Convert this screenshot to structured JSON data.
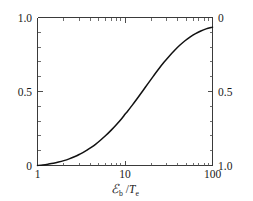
{
  "chart_data": {
    "type": "line",
    "title": "",
    "subtitle": "",
    "xlabel": "ℰb / Te",
    "xlabel_parts": {
      "numerator_symbol": "ℰ",
      "numerator_subscript": "b",
      "divider": "/",
      "denominator_symbol": "T",
      "denominator_subscript": "e"
    },
    "ylabel": "",
    "ylabel_right": "",
    "xscale": "log",
    "yscale": "linear",
    "xlim": [
      1,
      100
    ],
    "ylim": [
      0,
      1
    ],
    "ylim_right": [
      1,
      0
    ],
    "grid": false,
    "legend": false,
    "legend_position": "none",
    "xticks": [
      1,
      10,
      100
    ],
    "xtick_labels": [
      "1",
      "10",
      "100"
    ],
    "yticks_left": [
      0,
      0.5,
      1.0
    ],
    "ytick_labels_left": [
      "0",
      "0.5",
      "1.0"
    ],
    "yticks_right": [
      0,
      0.5,
      1.0
    ],
    "ytick_labels_right": [
      "0",
      "0.5",
      "1.0"
    ],
    "ytick_right_inverted": true,
    "ytick_minor_step_left": 0.1,
    "series": [
      {
        "name": "curve",
        "color": "#111111",
        "x": [
          1.0,
          1.15,
          1.32,
          1.52,
          1.74,
          2.0,
          2.3,
          2.64,
          3.03,
          3.48,
          4.0,
          4.6,
          5.27,
          6.06,
          6.96,
          8.0,
          9.19,
          10.0,
          10.55,
          12.12,
          13.93,
          16.0,
          18.38,
          21.11,
          24.25,
          27.86,
          32.0,
          36.76,
          42.22,
          48.5,
          55.72,
          64.0,
          73.52,
          84.45,
          100.0
        ],
        "y": [
          0.0,
          0.004,
          0.009,
          0.015,
          0.023,
          0.033,
          0.045,
          0.059,
          0.076,
          0.095,
          0.118,
          0.143,
          0.172,
          0.204,
          0.239,
          0.277,
          0.318,
          0.346,
          0.362,
          0.408,
          0.456,
          0.505,
          0.555,
          0.604,
          0.652,
          0.697,
          0.739,
          0.777,
          0.812,
          0.843,
          0.869,
          0.891,
          0.909,
          0.923,
          0.935
        ]
      }
    ]
  },
  "figure": {
    "background_color": "#ffffff",
    "axis_color": "#3a3a3a",
    "curve_color": "#111111"
  }
}
